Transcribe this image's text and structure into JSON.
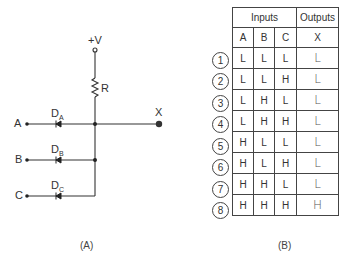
{
  "circuit": {
    "supply_label": "+V",
    "resistor_label": "R",
    "output_label": "X",
    "inputs": [
      {
        "label": "A",
        "diode": "D",
        "diode_sub": "A"
      },
      {
        "label": "B",
        "diode": "D",
        "diode_sub": "B"
      },
      {
        "label": "C",
        "diode": "D",
        "diode_sub": "C"
      }
    ],
    "caption": "(A)"
  },
  "truth_table": {
    "group_headers": {
      "inputs": "Inputs",
      "outputs": "Outputs"
    },
    "columns": [
      "A",
      "B",
      "C",
      "X"
    ],
    "rows": [
      {
        "num": "1",
        "A": "L",
        "B": "L",
        "C": "L",
        "X": "L"
      },
      {
        "num": "2",
        "A": "L",
        "B": "L",
        "C": "H",
        "X": "L"
      },
      {
        "num": "3",
        "A": "L",
        "B": "H",
        "C": "L",
        "X": "L"
      },
      {
        "num": "4",
        "A": "L",
        "B": "H",
        "C": "H",
        "X": "L"
      },
      {
        "num": "5",
        "A": "H",
        "B": "L",
        "C": "L",
        "X": "L"
      },
      {
        "num": "6",
        "A": "H",
        "B": "L",
        "C": "H",
        "X": "L"
      },
      {
        "num": "7",
        "A": "H",
        "B": "H",
        "C": "L",
        "X": "L"
      },
      {
        "num": "8",
        "A": "H",
        "B": "H",
        "C": "H",
        "X": "H"
      }
    ],
    "caption": "(B)"
  }
}
